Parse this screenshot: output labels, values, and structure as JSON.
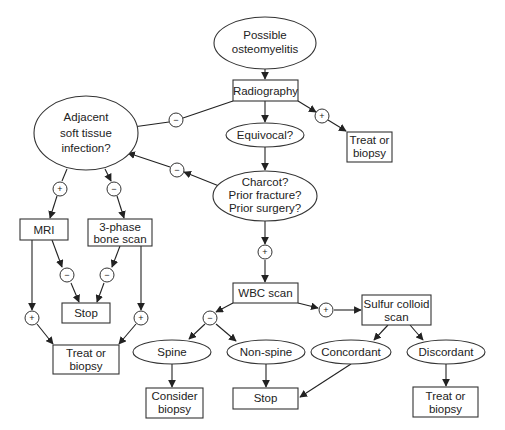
{
  "diagram": {
    "nodes": {
      "start": {
        "lines": [
          "Possible",
          "osteomyelitis"
        ],
        "shape": "ellipse"
      },
      "radiography": {
        "lines": [
          "Radiography"
        ],
        "shape": "rect"
      },
      "treat_top": {
        "lines": [
          "Treat or",
          "biopsy"
        ],
        "shape": "rect"
      },
      "equivocal": {
        "lines": [
          "Equivocal?"
        ],
        "shape": "ellipse"
      },
      "adjacent": {
        "lines": [
          "Adjacent",
          "soft tissue",
          "infection?"
        ],
        "shape": "ellipse"
      },
      "charcot": {
        "lines": [
          "Charcot?",
          "Prior fracture?",
          "Prior surgery?"
        ],
        "shape": "ellipse"
      },
      "mri": {
        "lines": [
          "MRI"
        ],
        "shape": "rect"
      },
      "bone_scan": {
        "lines": [
          "3-phase",
          "bone scan"
        ],
        "shape": "rect"
      },
      "stop_left": {
        "lines": [
          "Stop"
        ],
        "shape": "rect"
      },
      "treat_left": {
        "lines": [
          "Treat or",
          "biopsy"
        ],
        "shape": "rect"
      },
      "wbc": {
        "lines": [
          "WBC scan"
        ],
        "shape": "rect"
      },
      "sulfur": {
        "lines": [
          "Sulfur colloid",
          "scan"
        ],
        "shape": "rect"
      },
      "spine": {
        "lines": [
          "Spine"
        ],
        "shape": "ellipse"
      },
      "nonspine": {
        "lines": [
          "Non-spine"
        ],
        "shape": "ellipse"
      },
      "concordant": {
        "lines": [
          "Concordant"
        ],
        "shape": "ellipse"
      },
      "discordant": {
        "lines": [
          "Discordant"
        ],
        "shape": "ellipse"
      },
      "consider_biopsy": {
        "lines": [
          "Consider",
          "biopsy"
        ],
        "shape": "rect"
      },
      "stop_bottom": {
        "lines": [
          "Stop"
        ],
        "shape": "rect"
      },
      "treat_right": {
        "lines": [
          "Treat or",
          "biopsy"
        ],
        "shape": "rect"
      }
    },
    "signs": {
      "plus": "+",
      "minus": "−"
    },
    "edges": [
      {
        "from": "start",
        "to": "radiography",
        "sign": null
      },
      {
        "from": "radiography",
        "to": "adjacent",
        "sign": "minus"
      },
      {
        "from": "radiography",
        "to": "equivocal",
        "sign": null
      },
      {
        "from": "radiography",
        "to": "treat_top",
        "sign": "plus"
      },
      {
        "from": "equivocal",
        "to": "charcot",
        "sign": null
      },
      {
        "from": "charcot",
        "to": "adjacent",
        "sign": "minus"
      },
      {
        "from": "charcot",
        "to": "wbc",
        "sign": "plus"
      },
      {
        "from": "adjacent",
        "to": "mri",
        "sign": "plus"
      },
      {
        "from": "adjacent",
        "to": "bone_scan",
        "sign": "minus"
      },
      {
        "from": "mri",
        "to": "stop_left",
        "sign": "minus"
      },
      {
        "from": "bone_scan",
        "to": "stop_left",
        "sign": "minus"
      },
      {
        "from": "mri",
        "to": "treat_left",
        "sign": "plus"
      },
      {
        "from": "bone_scan",
        "to": "treat_left",
        "sign": "plus"
      },
      {
        "from": "wbc",
        "to": "spine",
        "sign": "minus"
      },
      {
        "from": "wbc",
        "to": "nonspine",
        "sign": "minus"
      },
      {
        "from": "wbc",
        "to": "sulfur",
        "sign": "plus"
      },
      {
        "from": "sulfur",
        "to": "concordant",
        "sign": null
      },
      {
        "from": "sulfur",
        "to": "discordant",
        "sign": null
      },
      {
        "from": "spine",
        "to": "consider_biopsy",
        "sign": null
      },
      {
        "from": "nonspine",
        "to": "stop_bottom",
        "sign": null
      },
      {
        "from": "concordant",
        "to": "stop_bottom",
        "sign": null
      },
      {
        "from": "discordant",
        "to": "treat_right",
        "sign": null
      }
    ]
  }
}
